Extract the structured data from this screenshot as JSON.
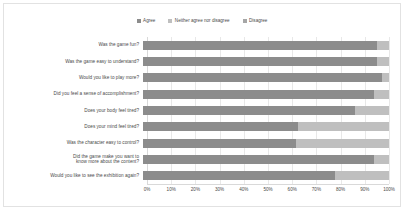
{
  "chart_data": {
    "type": "bar",
    "title": "",
    "subtitle": "",
    "xlabel": "",
    "ylabel": "",
    "orientation": "horizontal",
    "stacked": true,
    "stack_mode": "percent",
    "xlim": [
      0,
      100
    ],
    "grid": true,
    "legend_position": "top-center",
    "xtick_labels": [
      "0%",
      "10%",
      "20%",
      "30%",
      "40%",
      "50%",
      "60%",
      "70%",
      "80%",
      "90%",
      "100%"
    ],
    "xtick_values": [
      0,
      10,
      20,
      30,
      40,
      50,
      60,
      70,
      80,
      90,
      100
    ],
    "categories": [
      "Was the game fun?",
      "Was the game easy to understand?",
      "Would you like to play more?",
      "Did you feel a sense of accomplishment?",
      "Does your body feel tired?",
      "Does your mind feel tired?",
      "Was the character easy to control?",
      "Did the game make you want to\nknow more about the content?",
      "Would you like to see the exhibition again?"
    ],
    "series": [
      {
        "name": "Agree",
        "color": "#8c8c8c",
        "values": [
          95,
          95,
          97,
          94,
          86,
          63,
          62,
          94,
          78
        ]
      },
      {
        "name": "Neither agree nor disagree",
        "color": "#bfbfbf",
        "values": [
          5,
          5,
          3,
          6,
          14,
          37,
          38,
          6,
          22
        ]
      },
      {
        "name": "Disagree",
        "color": "#a6a6a6",
        "values": [
          0,
          0,
          0,
          0,
          0,
          0,
          0,
          0,
          0
        ]
      }
    ]
  },
  "legend": {
    "items": [
      {
        "label": "Agree",
        "color": "#8c8c8c"
      },
      {
        "label": "Neither agree nor disagree",
        "color": "#bfbfbf"
      },
      {
        "label": "Disagree",
        "color": "#a6a6a6"
      }
    ]
  },
  "colors": {
    "background": "#ffffff",
    "frame_border": "#e2e2e2",
    "gridline": "#e8e8e8",
    "axis_line": "#d9d9d9",
    "text": "#4a4a4a"
  }
}
